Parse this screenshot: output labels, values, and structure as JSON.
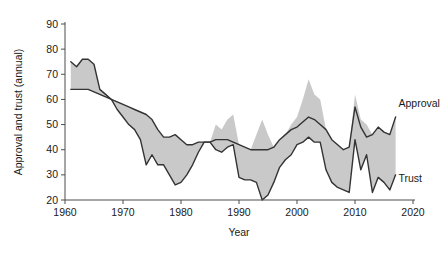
{
  "chart_data": {
    "type": "area",
    "title": "",
    "xlabel": "Year",
    "ylabel": "Approval and trust (annual)",
    "xlim": [
      1960,
      2020
    ],
    "ylim": [
      20,
      90
    ],
    "xticks": [
      1960,
      1970,
      1980,
      1990,
      2000,
      2010,
      2020
    ],
    "yticks": [
      20,
      30,
      40,
      50,
      60,
      70,
      80,
      90
    ],
    "grid": false,
    "legend_position": "right-inline",
    "fill_between": true,
    "fill_color": "#c9c9c9",
    "line_color": "#333333",
    "annotations": [
      {
        "text": "Approval",
        "x": 2017.5,
        "y": 57
      },
      {
        "text": "Trust",
        "x": 2017.5,
        "y": 27
      }
    ],
    "x": [
      1961,
      1962,
      1963,
      1964,
      1965,
      1966,
      1967,
      1968,
      1969,
      1970,
      1971,
      1972,
      1973,
      1974,
      1975,
      1976,
      1977,
      1978,
      1979,
      1980,
      1981,
      1982,
      1983,
      1984,
      1985,
      1986,
      1987,
      1988,
      1989,
      1990,
      1991,
      1992,
      1993,
      1994,
      1995,
      1996,
      1997,
      1998,
      1999,
      2000,
      2001,
      2002,
      2003,
      2004,
      2005,
      2006,
      2007,
      2008,
      2009,
      2010,
      2011,
      2012,
      2013,
      2014,
      2015,
      2016,
      2017
    ],
    "series": [
      {
        "name": "Approval",
        "values": [
          64,
          64,
          64,
          64,
          63,
          62,
          61,
          60,
          59,
          58,
          57,
          56,
          55,
          54,
          52,
          48,
          45,
          45,
          46,
          44,
          42,
          42,
          43,
          43,
          43,
          44,
          44,
          44,
          43,
          42,
          41,
          40,
          40,
          40,
          40,
          41,
          44,
          46,
          48,
          49,
          51,
          53,
          52,
          50,
          48,
          44,
          42,
          40,
          41,
          57,
          49,
          45,
          46,
          49,
          47,
          46,
          53
        ],
        "color": "#333333"
      },
      {
        "name": "Trust",
        "values": [
          75,
          73,
          76,
          76,
          74,
          64,
          62,
          60,
          56,
          53,
          50,
          48,
          44,
          34,
          38,
          34,
          34,
          30,
          26,
          27,
          30,
          34,
          39,
          43,
          43,
          40,
          39,
          41,
          42,
          29,
          28,
          28,
          27,
          20,
          22,
          27,
          33,
          36,
          38,
          42,
          43,
          45,
          43,
          43,
          32,
          27,
          25,
          24,
          23,
          44,
          32,
          38,
          23,
          29,
          27,
          24,
          30
        ],
        "color": "#333333"
      }
    ],
    "band_upper": [
      75,
      73,
      76,
      76,
      74,
      64,
      62,
      60,
      59,
      58,
      57,
      56,
      55,
      54,
      52,
      48,
      45,
      45,
      46,
      44,
      42,
      42,
      43,
      43,
      43,
      50,
      48,
      52,
      54,
      42,
      41,
      40,
      46,
      52,
      46,
      41,
      44,
      46,
      50,
      53,
      60,
      68,
      62,
      60,
      48,
      44,
      42,
      40,
      41,
      62,
      52,
      50,
      46,
      49,
      47,
      46,
      53
    ],
    "band_lower": [
      64,
      64,
      64,
      64,
      63,
      62,
      61,
      60,
      56,
      53,
      50,
      48,
      44,
      34,
      38,
      34,
      34,
      30,
      26,
      27,
      30,
      34,
      39,
      43,
      43,
      40,
      39,
      41,
      42,
      29,
      28,
      28,
      27,
      20,
      22,
      27,
      33,
      36,
      38,
      42,
      43,
      45,
      43,
      43,
      32,
      27,
      25,
      24,
      23,
      44,
      32,
      38,
      23,
      29,
      27,
      24,
      30
    ]
  },
  "axes": {
    "ytick_labels": [
      "20",
      "30",
      "40",
      "50",
      "60",
      "70",
      "80",
      "90"
    ],
    "xtick_labels": [
      "1960",
      "1970",
      "1980",
      "1990",
      "2000",
      "2010",
      "2020"
    ],
    "x_axis_title": "Year",
    "y_axis_title": "Approval and trust (annual)"
  },
  "labels": {
    "approval": "Approval",
    "trust": "Trust"
  }
}
